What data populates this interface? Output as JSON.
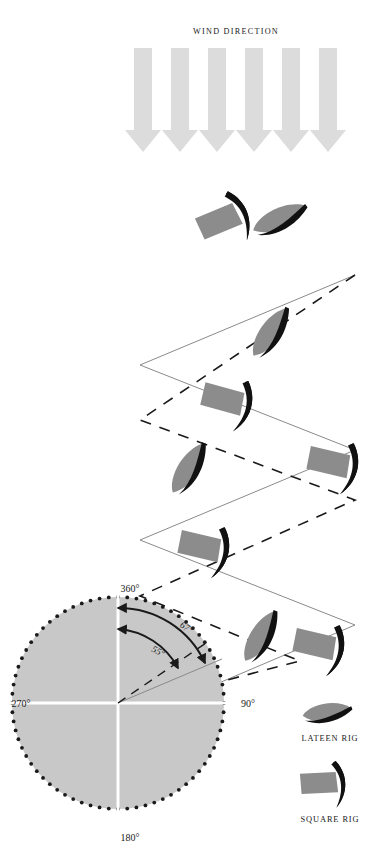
{
  "figure": {
    "title": "WIND DIRECTION",
    "background_color": "#ffffff",
    "ink_color": "#1a1a1a"
  },
  "palette": {
    "wind_arrow": "#dcdcdc",
    "hull": "#8c8c8c",
    "sail": "#111111",
    "compass_face": "#c8c8c8",
    "compass_cross": "#ffffff",
    "compass_dot": "#1a1a1a",
    "track_line": "#8a8a8a"
  },
  "wind": {
    "label": "WIND DIRECTION",
    "arrow_count": 6,
    "direction": "down",
    "arrow_name": "wind-arrow"
  },
  "compass": {
    "labels": {
      "north": "360°",
      "east": "90°",
      "south": "180°",
      "west": "270°"
    },
    "center": {
      "x": 118,
      "y": 703
    },
    "radius": 110,
    "tick_count": 72,
    "angles": [
      {
        "id": "lateen-angle",
        "value": "55°",
        "degrees": 55,
        "rig": "LATEEN RIG",
        "description": "closest angle to the wind achievable by a lateen rig"
      },
      {
        "id": "square-angle",
        "value": "67°",
        "degrees": 67,
        "rig": "SQUARE RIG",
        "description": "closest angle to the wind achievable by a square rig"
      }
    ]
  },
  "legend": {
    "items": [
      {
        "id": "lateen",
        "label": "LATEEN RIG",
        "hull_shape": "lens",
        "line_style": "solid"
      },
      {
        "id": "square",
        "label": "SQUARE RIG",
        "hull_shape": "rectangle",
        "line_style": "dashed"
      }
    ]
  },
  "tracks": [
    {
      "id": "lateen-track",
      "rig": "LATEEN RIG",
      "line_style": "solid",
      "points": "355,275 140,365 355,450 140,540 355,625 190,695"
    },
    {
      "id": "square-track",
      "rig": "SQUARE RIG",
      "line_style": "dashed",
      "points": "355,275 140,420 355,500 140,595 300,660 150,700"
    }
  ],
  "boats": [
    {
      "id": "boat-1",
      "rig": "SQUARE RIG",
      "x": 222,
      "y": 220,
      "rotation": -20
    },
    {
      "id": "boat-2",
      "rig": "LATEEN RIG",
      "x": 280,
      "y": 220,
      "rotation": -24
    },
    {
      "id": "boat-3",
      "rig": "LATEEN RIG",
      "x": 272,
      "y": 332,
      "rotation": -55
    },
    {
      "id": "boat-4",
      "rig": "SQUARE RIG",
      "x": 222,
      "y": 400,
      "rotation": 20
    },
    {
      "id": "boat-5",
      "rig": "LATEEN RIG",
      "x": 190,
      "y": 468,
      "rotation": -58
    },
    {
      "id": "boat-6",
      "rig": "SQUARE RIG",
      "x": 330,
      "y": 463,
      "rotation": 18
    },
    {
      "id": "boat-7",
      "rig": "SQUARE RIG",
      "x": 200,
      "y": 547,
      "rotation": 18
    },
    {
      "id": "boat-8",
      "rig": "LATEEN RIG",
      "x": 262,
      "y": 636,
      "rotation": -60
    },
    {
      "id": "boat-9",
      "rig": "SQUARE RIG",
      "x": 315,
      "y": 645,
      "rotation": 18
    }
  ]
}
